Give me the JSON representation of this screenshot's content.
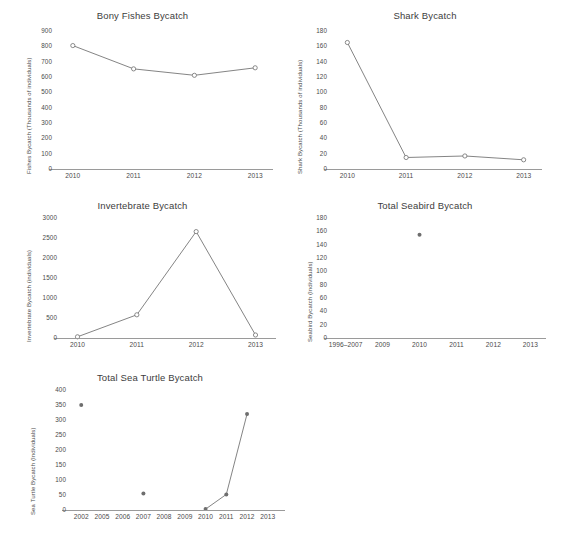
{
  "figure": {
    "background": "#ffffff",
    "line_color": "#6e6e6e",
    "axis_color": "#9a9a9a",
    "text_color": "#4a4a4a",
    "marker_open": "open-circle",
    "marker_filled": "filled-circle"
  },
  "chart_data": [
    {
      "id": "bony-fishes",
      "type": "line",
      "title": "Bony Fishes Bycatch",
      "xlabel": "",
      "ylabel": "Fishes Bycatch (Thousands of individuals)",
      "categories": [
        "2010",
        "2011",
        "2012",
        "2013"
      ],
      "values": [
        805,
        653,
        611,
        660
      ],
      "ylim": [
        0,
        900
      ],
      "yticks": [
        0,
        100,
        200,
        300,
        400,
        500,
        600,
        700,
        800,
        900
      ],
      "grid": false,
      "legend": "none",
      "marker": "open-circle"
    },
    {
      "id": "shark",
      "type": "line",
      "title": "Shark Bycatch",
      "xlabel": "",
      "ylabel": "Shark Bycatch (Thousands of individuals)",
      "categories": [
        "2010",
        "2011",
        "2012",
        "2013"
      ],
      "values": [
        165,
        15,
        17,
        12
      ],
      "ylim": [
        0,
        180
      ],
      "yticks": [
        0,
        20,
        40,
        60,
        80,
        100,
        120,
        140,
        160,
        180
      ],
      "grid": false,
      "legend": "none",
      "marker": "open-circle"
    },
    {
      "id": "invertebrate",
      "type": "line",
      "title": "Invertebrate Bycatch",
      "xlabel": "",
      "ylabel": "Invertebrate Bycatch (individuals)",
      "categories": [
        "2010",
        "2011",
        "2012",
        "2013"
      ],
      "values": [
        30,
        580,
        2660,
        75
      ],
      "ylim": [
        0,
        3000
      ],
      "yticks": [
        0,
        500,
        1000,
        1500,
        2000,
        2500,
        3000
      ],
      "grid": false,
      "legend": "none",
      "marker": "open-circle"
    },
    {
      "id": "seabird",
      "type": "scatter",
      "title": "Total Seabird Bycatch",
      "xlabel": "",
      "ylabel": "Seabird Bycatch (Individuals)",
      "categories": [
        "1996–2007",
        "2009",
        "2010",
        "2011",
        "2012",
        "2013"
      ],
      "values": [
        null,
        null,
        155,
        null,
        null,
        null
      ],
      "ylim": [
        0,
        180
      ],
      "yticks": [
        0,
        20,
        40,
        60,
        80,
        100,
        120,
        140,
        160,
        180
      ],
      "grid": false,
      "legend": "none",
      "marker": "filled-circle"
    },
    {
      "id": "sea-turtle",
      "type": "line",
      "title": "Total Sea Turtle Bycatch",
      "xlabel": "",
      "ylabel": "Sea Turtle Bycatch (Individuals)",
      "categories": [
        "2002",
        "2005",
        "2006",
        "2007",
        "2008",
        "2009",
        "2010",
        "2011",
        "2012",
        "2013"
      ],
      "values": [
        350,
        null,
        null,
        55,
        null,
        null,
        3,
        52,
        320,
        null
      ],
      "connected_from_index": 6,
      "connected_to_index": 8,
      "ylim": [
        0,
        400
      ],
      "yticks": [
        0,
        50,
        100,
        150,
        200,
        250,
        300,
        350,
        400
      ],
      "grid": false,
      "legend": "none",
      "marker": "filled-circle"
    }
  ]
}
